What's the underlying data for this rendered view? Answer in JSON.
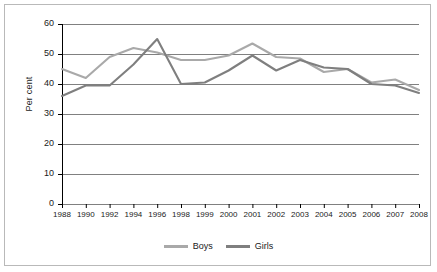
{
  "chart_data": {
    "type": "line",
    "title": "",
    "xlabel": "",
    "ylabel": "Per cent",
    "ylim": [
      0,
      60
    ],
    "ytick_step": 10,
    "yticks": [
      0,
      10,
      20,
      30,
      40,
      50,
      60
    ],
    "grid": true,
    "legend_position": "bottom",
    "categories": [
      "1988",
      "1990",
      "1992",
      "1994",
      "1996",
      "1998",
      "1999",
      "2000",
      "2001",
      "2002",
      "2003",
      "2004",
      "2005",
      "2006",
      "2007",
      "2008"
    ],
    "series": [
      {
        "name": "Boys",
        "color": "#a9a9a9",
        "values": [
          45.0,
          42.0,
          49.0,
          52.0,
          50.5,
          48.0,
          48.0,
          49.5,
          53.5,
          49.0,
          48.5,
          44.0,
          45.0,
          40.5,
          41.5,
          38.0
        ]
      },
      {
        "name": "Girls",
        "color": "#7f7f7f",
        "values": [
          36.0,
          39.5,
          39.5,
          46.5,
          55.0,
          40.0,
          40.5,
          44.5,
          49.5,
          44.5,
          48.0,
          45.5,
          45.0,
          40.0,
          39.5,
          37.0
        ]
      }
    ]
  },
  "axis": {
    "y_title": "Per cent"
  },
  "legend": {
    "items": [
      {
        "label": "Boys",
        "color": "#a9a9a9"
      },
      {
        "label": "Girls",
        "color": "#7f7f7f"
      }
    ]
  },
  "style": {
    "gridline_color": "#808080",
    "axis_color": "#000000",
    "frame_color": "#b9b9b9",
    "background": "#ffffff"
  }
}
